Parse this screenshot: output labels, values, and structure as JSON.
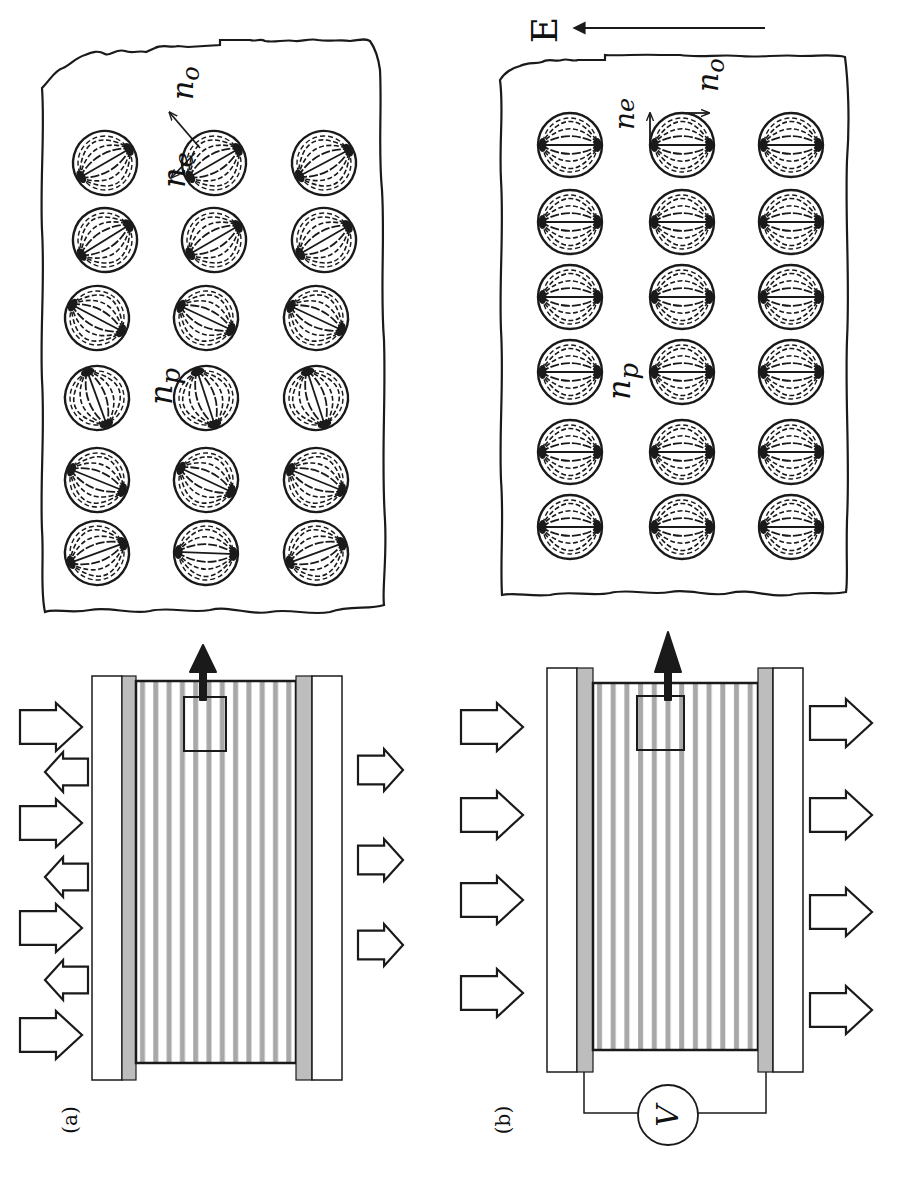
{
  "figure": {
    "panels": [
      {
        "id": "a",
        "label": "(a)",
        "state": "field-off",
        "inset": {
          "labels": {
            "np": "n",
            "np_sub": "p",
            "ne": "n",
            "ne_sub": "e",
            "no": "n",
            "no_sub": "o"
          },
          "droplet_columns_x": [
            105,
            214,
            324
          ],
          "droplet_rows_y": [
            163,
            240,
            318,
            398,
            480,
            553
          ],
          "droplet_radius": 32,
          "director_angles_deg": [
            [
              -30,
              -30,
              -28
            ],
            [
              -32,
              -30,
              -30
            ],
            [
              28,
              25,
              25
            ],
            [
              70,
              72,
              72
            ],
            [
              22,
              25,
              22
            ],
            [
              -20,
              2,
              -20
            ]
          ]
        },
        "incident_arrows": {
          "forward": 4,
          "reflected": 3
        },
        "transmitted_arrows": 3
      },
      {
        "id": "b",
        "label": "(b)",
        "state": "field-on",
        "field_label": "E",
        "voltage_label": "V",
        "inset": {
          "labels": {
            "np": "n",
            "np_sub": "p",
            "ne": "n",
            "ne_sub": "e",
            "no": "n",
            "no_sub": "o"
          },
          "droplet_columns_x": [
            570,
            682,
            791
          ],
          "droplet_rows_y": [
            145,
            222,
            297,
            372,
            452,
            527
          ],
          "droplet_radius": 32,
          "director_angles_deg": [
            [
              0,
              0,
              0
            ],
            [
              0,
              0,
              0
            ],
            [
              0,
              0,
              0
            ],
            [
              0,
              0,
              0
            ],
            [
              0,
              0,
              0
            ],
            [
              0,
              0,
              0
            ]
          ]
        },
        "incident_arrows": {
          "forward": 4,
          "reflected": 0
        },
        "transmitted_arrows": 4
      }
    ],
    "colors": {
      "ink": "#1a1a1a",
      "electrode": "#bdbdbd",
      "stripe": "#a8a8a8",
      "background": "#ffffff"
    }
  }
}
